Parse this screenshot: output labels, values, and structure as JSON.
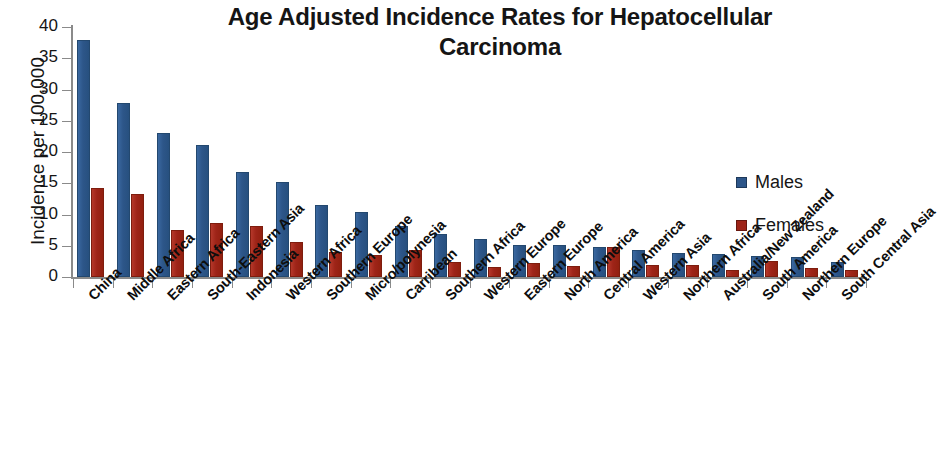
{
  "chart_data": {
    "type": "bar",
    "title": "Age Adjusted Incidence Rates for Hepatocellular Carcinoma",
    "title_line_1": "Age Adjusted Incidence Rates for Hepatocellular",
    "title_line_2": "Carcinoma",
    "xlabel": "",
    "ylabel": "Incidence per 100,000",
    "ylim": [
      0,
      40
    ],
    "ytick_labels": [
      "0",
      "5",
      "10",
      "15",
      "20",
      "25",
      "30",
      "35",
      "40"
    ],
    "yticks": [
      0,
      5,
      10,
      15,
      20,
      25,
      30,
      35,
      40
    ],
    "grid": false,
    "legend_position": "right-inside",
    "categories": [
      "China",
      "Middle Africa",
      "Eastern Africa",
      "South-Eastern Asia",
      "Indonesia",
      "Western Africa",
      "Southern Europe",
      "Micro/polynesia",
      "Carribean",
      "Southern Africa",
      "Western Europe",
      "Eastern Europe",
      "North America",
      "Central America",
      "Western Asia",
      "Northern Africa",
      "Australia/New Zealand",
      "South America",
      "Northern Europe",
      "South Central Asia"
    ],
    "series": [
      {
        "name": "Males",
        "color": "#2d5689",
        "values": [
          38.0,
          27.8,
          23.0,
          21.1,
          16.8,
          15.2,
          11.6,
          10.4,
          8.2,
          6.9,
          6.1,
          5.2,
          5.2,
          4.8,
          4.4,
          3.9,
          3.7,
          3.4,
          3.2,
          2.4
        ]
      },
      {
        "name": "Females",
        "color": "#9e2418",
        "values": [
          14.2,
          13.3,
          7.6,
          8.6,
          8.1,
          5.6,
          4.0,
          3.5,
          4.4,
          2.4,
          1.6,
          2.2,
          1.8,
          4.8,
          1.9,
          1.9,
          1.2,
          2.6,
          1.5,
          1.1
        ]
      }
    ]
  },
  "legend": {
    "items": [
      {
        "label": "Males",
        "color": "#2d5689"
      },
      {
        "label": "Females",
        "color": "#9e2418"
      }
    ]
  }
}
